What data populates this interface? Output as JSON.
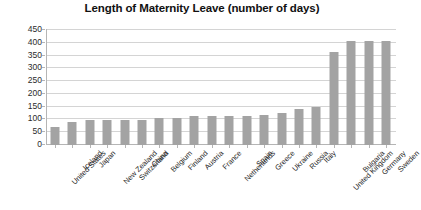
{
  "chart_data": {
    "type": "bar",
    "title": "Length of Maternity Leave (number of days)",
    "xlabel": "",
    "ylabel": "",
    "ylim": [
      0,
      450
    ],
    "ytick_step": 50,
    "yticks": [
      0,
      50,
      100,
      150,
      200,
      250,
      300,
      350,
      400,
      450
    ],
    "grid": true,
    "legend": false,
    "bar_color": "#a3a3a3",
    "gridline_color": "#d4d4d4",
    "axis_color": "#b5b5b5",
    "background_color": "#ffffff",
    "categories": [
      "United States",
      "Iceland",
      "Japan",
      "New Zealand",
      "Switzerland",
      "China",
      "Belgium",
      "Finland",
      "Austria",
      "France",
      "Netherlands",
      "Spain",
      "Greece",
      "Ukraine",
      "Russia",
      "Italy",
      "United Kingdom",
      "Bulgaria",
      "Germany",
      "Sweden"
    ],
    "values": [
      70,
      90,
      98,
      98,
      98,
      98,
      105,
      105,
      112,
      112,
      112,
      112,
      119,
      126,
      140,
      147,
      364,
      406,
      406,
      406
    ]
  }
}
